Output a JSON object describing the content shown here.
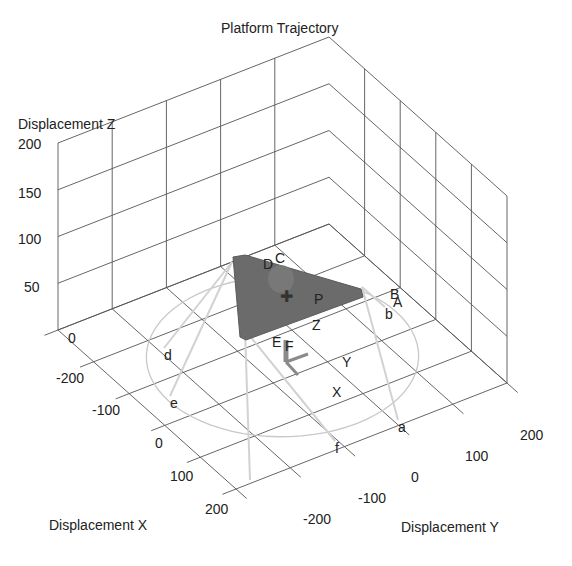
{
  "chart_data": {
    "type": "scatter3d",
    "title": "Platform Trajectory",
    "xlabel": "Displacement X",
    "ylabel": "Displacement Y",
    "zlabel": "Displacement Z",
    "xlim": [
      -250,
      250
    ],
    "ylim": [
      -250,
      250
    ],
    "zlim": [
      0,
      200
    ],
    "x_ticks": [
      "-200",
      "-100",
      "0",
      "100",
      "200"
    ],
    "y_ticks": [
      "-200",
      "-100",
      "0",
      "100",
      "200"
    ],
    "z_ticks": [
      "0",
      "50",
      "100",
      "150",
      "200"
    ],
    "grid": true,
    "base_circle_label_points": [
      "a",
      "b",
      "d",
      "e",
      "f"
    ],
    "platform_label_points": [
      "A",
      "B",
      "C",
      "D",
      "E",
      "F",
      "P"
    ],
    "frame_axis_labels": [
      "X",
      "Y",
      "Z"
    ],
    "colors": {
      "grid": "#555555",
      "platform": "#6b6b6b",
      "trajectory": "#c8c8c8",
      "frame_arrow": "#8a8a8a"
    }
  },
  "labels": {
    "title": "Platform Trajectory",
    "xlabel": "Displacement X",
    "ylabel": "Displacement Y",
    "zlabel": "Displacement Z"
  },
  "ticks": {
    "z": [
      {
        "text": "200",
        "x": 18,
        "y": 137
      },
      {
        "text": "150",
        "x": 18,
        "y": 186
      },
      {
        "text": "100",
        "x": 18,
        "y": 232
      },
      {
        "text": "50",
        "x": 24,
        "y": 280
      },
      {
        "text": "0",
        "x": 68,
        "y": 331
      }
    ],
    "x": [
      {
        "text": "-200",
        "x": 56,
        "y": 371
      },
      {
        "text": "-100",
        "x": 92,
        "y": 403
      },
      {
        "text": "0",
        "x": 155,
        "y": 436
      },
      {
        "text": "100",
        "x": 170,
        "y": 469
      },
      {
        "text": "200",
        "x": 205,
        "y": 502
      }
    ],
    "y": [
      {
        "text": "-200",
        "x": 303,
        "y": 512
      },
      {
        "text": "-100",
        "x": 358,
        "y": 491
      },
      {
        "text": "0",
        "x": 411,
        "y": 470
      },
      {
        "text": "100",
        "x": 465,
        "y": 449
      },
      {
        "text": "200",
        "x": 520,
        "y": 428
      }
    ]
  },
  "annotations": [
    {
      "text": "D",
      "x": 263,
      "y": 257
    },
    {
      "text": "C",
      "x": 275,
      "y": 251
    },
    {
      "text": "P",
      "x": 314,
      "y": 292
    },
    {
      "text": "Z",
      "x": 312,
      "y": 318
    },
    {
      "text": "E",
      "x": 272,
      "y": 335
    },
    {
      "text": "F",
      "x": 285,
      "y": 339
    },
    {
      "text": "Y",
      "x": 342,
      "y": 355
    },
    {
      "text": "X",
      "x": 332,
      "y": 385
    },
    {
      "text": "B",
      "x": 390,
      "y": 287
    },
    {
      "text": "A",
      "x": 393,
      "y": 295
    },
    {
      "text": "b",
      "x": 385,
      "y": 307
    },
    {
      "text": "d",
      "x": 164,
      "y": 348
    },
    {
      "text": "e",
      "x": 170,
      "y": 396
    },
    {
      "text": "a",
      "x": 398,
      "y": 420
    },
    {
      "text": "f",
      "x": 335,
      "y": 441
    }
  ]
}
